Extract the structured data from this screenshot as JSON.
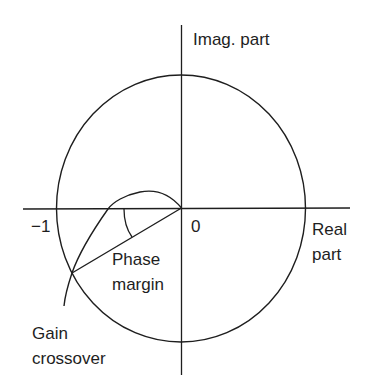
{
  "diagram": {
    "type": "nyquist_plot_unit_circle",
    "axes": {
      "vertical_label": "Imag. part",
      "horizontal_label_line1": "Real",
      "horizontal_label_line2": "part"
    },
    "ticks": {
      "minus_one": "−1",
      "origin": "0"
    },
    "annotations": {
      "phase_margin_line1": "Phase",
      "phase_margin_line2": "margin",
      "gain_crossover_line1": "Gain",
      "gain_crossover_line2": "crossover"
    },
    "colors": {
      "stroke": "#1e1e1e",
      "background": "#ffffff"
    }
  }
}
